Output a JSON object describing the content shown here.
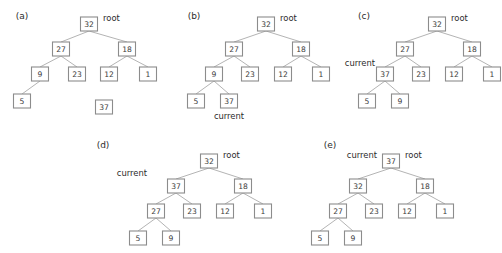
{
  "figure": {
    "background_color": "#ffffff",
    "node_fill_color": "#ffffff",
    "node_border_color": "#8c8c8c",
    "edge_color": "#b4b4b4",
    "text_color": "#2b2b2b",
    "width": 502,
    "height": 253
  },
  "panels": [
    {
      "id": "a",
      "caption": "(a)",
      "caption_x": 22,
      "caption_y": 16,
      "origin_x": 0,
      "origin_y": 0,
      "nodes": [
        {
          "label": "32",
          "x": 89,
          "y": 24
        },
        {
          "label": "27",
          "x": 61,
          "y": 49
        },
        {
          "label": "18",
          "x": 127,
          "y": 49
        },
        {
          "label": "9",
          "x": 40,
          "y": 74
        },
        {
          "label": "23",
          "x": 77,
          "y": 74
        },
        {
          "label": "12",
          "x": 109,
          "y": 74
        },
        {
          "label": "1",
          "x": 148,
          "y": 74
        },
        {
          "label": "5",
          "x": 22,
          "y": 101
        },
        {
          "label": "37",
          "x": 104,
          "y": 107
        }
      ],
      "edges": [
        {
          "from": 0,
          "to": 1
        },
        {
          "from": 0,
          "to": 2
        },
        {
          "from": 1,
          "to": 3
        },
        {
          "from": 1,
          "to": 4
        },
        {
          "from": 2,
          "to": 5
        },
        {
          "from": 2,
          "to": 6
        },
        {
          "from": 3,
          "to": 7
        }
      ],
      "annotations": [
        {
          "text": "root",
          "x": 103,
          "y": 18,
          "align": "right"
        }
      ]
    },
    {
      "id": "b",
      "caption": "(b)",
      "caption_x": 194,
      "caption_y": 16,
      "origin_x": 0,
      "origin_y": 0,
      "nodes": [
        {
          "label": "32",
          "x": 266,
          "y": 24
        },
        {
          "label": "27",
          "x": 234,
          "y": 49
        },
        {
          "label": "18",
          "x": 301,
          "y": 49
        },
        {
          "label": "9",
          "x": 214,
          "y": 74
        },
        {
          "label": "23",
          "x": 250,
          "y": 74
        },
        {
          "label": "12",
          "x": 283,
          "y": 74
        },
        {
          "label": "1",
          "x": 321,
          "y": 74
        },
        {
          "label": "5",
          "x": 196,
          "y": 101
        },
        {
          "label": "37",
          "x": 229,
          "y": 101
        }
      ],
      "edges": [
        {
          "from": 0,
          "to": 1
        },
        {
          "from": 0,
          "to": 2
        },
        {
          "from": 1,
          "to": 3
        },
        {
          "from": 1,
          "to": 4
        },
        {
          "from": 2,
          "to": 5
        },
        {
          "from": 2,
          "to": 6
        },
        {
          "from": 3,
          "to": 7
        },
        {
          "from": 3,
          "to": 8
        }
      ],
      "annotations": [
        {
          "text": "root",
          "x": 280,
          "y": 18,
          "align": "right"
        },
        {
          "text": "current",
          "x": 229,
          "y": 116,
          "align": "center"
        }
      ]
    },
    {
      "id": "c",
      "caption": "(c)",
      "caption_x": 364,
      "caption_y": 16,
      "origin_x": 0,
      "origin_y": 0,
      "nodes": [
        {
          "label": "32",
          "x": 437,
          "y": 24
        },
        {
          "label": "27",
          "x": 405,
          "y": 49
        },
        {
          "label": "18",
          "x": 472,
          "y": 49
        },
        {
          "label": "37",
          "x": 385,
          "y": 74
        },
        {
          "label": "23",
          "x": 421,
          "y": 74
        },
        {
          "label": "12",
          "x": 454,
          "y": 74
        },
        {
          "label": "1",
          "x": 492,
          "y": 74
        },
        {
          "label": "5",
          "x": 367,
          "y": 101
        },
        {
          "label": "9",
          "x": 400,
          "y": 101
        }
      ],
      "edges": [
        {
          "from": 0,
          "to": 1
        },
        {
          "from": 0,
          "to": 2
        },
        {
          "from": 1,
          "to": 3
        },
        {
          "from": 1,
          "to": 4
        },
        {
          "from": 2,
          "to": 5
        },
        {
          "from": 2,
          "to": 6
        },
        {
          "from": 3,
          "to": 7
        },
        {
          "from": 3,
          "to": 8
        }
      ],
      "annotations": [
        {
          "text": "root",
          "x": 451,
          "y": 18,
          "align": "right"
        },
        {
          "text": "current",
          "x": 375,
          "y": 63,
          "align": "end"
        }
      ]
    },
    {
      "id": "d",
      "caption": "(d)",
      "caption_x": 103,
      "caption_y": 145,
      "origin_x": 0,
      "origin_y": 0,
      "nodes": [
        {
          "label": "32",
          "x": 209,
          "y": 161
        },
        {
          "label": "37",
          "x": 176,
          "y": 186
        },
        {
          "label": "18",
          "x": 243,
          "y": 186
        },
        {
          "label": "27",
          "x": 156,
          "y": 211
        },
        {
          "label": "23",
          "x": 192,
          "y": 211
        },
        {
          "label": "12",
          "x": 225,
          "y": 211
        },
        {
          "label": "1",
          "x": 263,
          "y": 211
        },
        {
          "label": "5",
          "x": 138,
          "y": 238
        },
        {
          "label": "9",
          "x": 171,
          "y": 238
        }
      ],
      "edges": [
        {
          "from": 0,
          "to": 1
        },
        {
          "from": 0,
          "to": 2
        },
        {
          "from": 1,
          "to": 3
        },
        {
          "from": 1,
          "to": 4
        },
        {
          "from": 2,
          "to": 5
        },
        {
          "from": 2,
          "to": 6
        },
        {
          "from": 3,
          "to": 7
        },
        {
          "from": 3,
          "to": 8
        }
      ],
      "annotations": [
        {
          "text": "root",
          "x": 223,
          "y": 155,
          "align": "right"
        },
        {
          "text": "current",
          "x": 147,
          "y": 173,
          "align": "end"
        }
      ]
    },
    {
      "id": "e",
      "caption": "(e)",
      "caption_x": 330,
      "caption_y": 145,
      "origin_x": 0,
      "origin_y": 0,
      "nodes": [
        {
          "label": "37",
          "x": 391,
          "y": 161
        },
        {
          "label": "32",
          "x": 358,
          "y": 186
        },
        {
          "label": "18",
          "x": 425,
          "y": 186
        },
        {
          "label": "27",
          "x": 338,
          "y": 211
        },
        {
          "label": "23",
          "x": 374,
          "y": 211
        },
        {
          "label": "12",
          "x": 407,
          "y": 211
        },
        {
          "label": "1",
          "x": 445,
          "y": 211
        },
        {
          "label": "5",
          "x": 320,
          "y": 238
        },
        {
          "label": "9",
          "x": 353,
          "y": 238
        }
      ],
      "edges": [
        {
          "from": 0,
          "to": 1
        },
        {
          "from": 0,
          "to": 2
        },
        {
          "from": 1,
          "to": 3
        },
        {
          "from": 1,
          "to": 4
        },
        {
          "from": 2,
          "to": 5
        },
        {
          "from": 2,
          "to": 6
        },
        {
          "from": 3,
          "to": 7
        },
        {
          "from": 3,
          "to": 8
        }
      ],
      "annotations": [
        {
          "text": "root",
          "x": 405,
          "y": 155,
          "align": "right"
        },
        {
          "text": "current",
          "x": 377,
          "y": 155,
          "align": "end"
        }
      ]
    }
  ],
  "node_geometry": {
    "width": 17,
    "height": 14,
    "corner_radius": 0
  }
}
